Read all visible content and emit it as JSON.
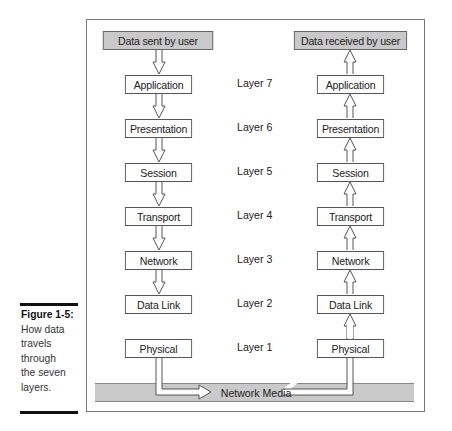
{
  "diagram": {
    "top_left": "Data sent by user",
    "top_right": "Data received by user",
    "layers": [
      {
        "name": "Application",
        "label": "Layer 7"
      },
      {
        "name": "Presentation",
        "label": "Layer 6"
      },
      {
        "name": "Session",
        "label": "Layer 5"
      },
      {
        "name": "Transport",
        "label": "Layer 4"
      },
      {
        "name": "Network",
        "label": "Layer 3"
      },
      {
        "name": "Data Link",
        "label": "Layer 2"
      },
      {
        "name": "Physical",
        "label": "Layer 1"
      }
    ],
    "media": "Network Media"
  },
  "caption": {
    "title": "Figure 1-5:",
    "lines": [
      "How data",
      "travels",
      "through",
      "the seven",
      "layers."
    ]
  }
}
